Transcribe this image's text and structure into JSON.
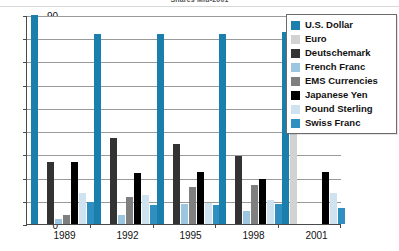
{
  "title": "Shares Mid-2001",
  "legend": {
    "position": "top-right",
    "items": [
      {
        "label": "U.S. Dollar",
        "color": "#1a7fad"
      },
      {
        "label": "Euro",
        "color": "#d2d2d2"
      },
      {
        "label": "Deutschemark",
        "color": "#333333"
      },
      {
        "label": "French Franc",
        "color": "#9cc6e0"
      },
      {
        "label": "EMS Currencies",
        "color": "#7f7f7f"
      },
      {
        "label": "Japanese Yen",
        "color": "#000000"
      },
      {
        "label": "Pound Sterling",
        "color": "#cfe2ef"
      },
      {
        "label": "Swiss Franc",
        "color": "#2e8fc0"
      }
    ]
  },
  "yaxis": {
    "ticks": [
      "90",
      "80",
      "70",
      "60",
      "50",
      "40",
      "30",
      "20",
      "10",
      "0"
    ],
    "min": 0,
    "max": 90
  },
  "xaxis": {
    "labels": [
      "1989",
      "1992",
      "1995",
      "1998",
      "2001"
    ]
  },
  "chart_data": {
    "type": "bar",
    "title": "Shares Mid-2001",
    "xlabel": "",
    "ylabel": "",
    "ylim": [
      0,
      90
    ],
    "grid": true,
    "legend_position": "top-right",
    "categories": [
      "1989",
      "1992",
      "1995",
      "1998",
      "2001"
    ],
    "series": [
      {
        "name": "U.S. Dollar",
        "color": "#1a7fad",
        "values": [
          90.0,
          82.0,
          82.0,
          82.0,
          82.5
        ]
      },
      {
        "name": "Euro",
        "color": "#d2d2d2",
        "values": [
          null,
          null,
          null,
          null,
          39.0
        ]
      },
      {
        "name": "Deutschemark",
        "color": "#333333",
        "values": [
          26.5,
          37.0,
          34.5,
          29.5,
          null
        ]
      },
      {
        "name": "French Franc",
        "color": "#9cc6e0",
        "values": [
          2.0,
          4.0,
          8.5,
          5.5,
          null
        ]
      },
      {
        "name": "EMS Currencies",
        "color": "#7f7f7f",
        "values": [
          4.0,
          11.5,
          16.0,
          17.0,
          null
        ]
      },
      {
        "name": "Japanese Yen",
        "color": "#000000",
        "values": [
          26.5,
          22.0,
          22.5,
          19.5,
          22.5
        ]
      },
      {
        "name": "Pound Sterling",
        "color": "#cfe2ef",
        "values": [
          13.5,
          12.5,
          9.0,
          10.5,
          13.5
        ]
      },
      {
        "name": "Swiss Franc",
        "color": "#2e8fc0",
        "values": [
          9.5,
          8.0,
          8.0,
          8.5,
          7.0
        ]
      }
    ]
  }
}
